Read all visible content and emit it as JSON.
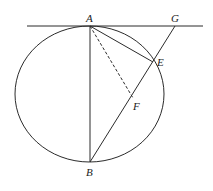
{
  "diagram": {
    "type": "geometry",
    "circle": {
      "cx": 89.5,
      "cy": 94,
      "rx": 74.5,
      "ry": 68
    },
    "tangent_line": {
      "x1": 27,
      "y1": 26,
      "x2": 203,
      "y2": 26
    },
    "points": {
      "A": {
        "label": "A",
        "x": 90,
        "y": 26
      },
      "G": {
        "label": "G",
        "x": 175,
        "y": 26
      },
      "E": {
        "label": "E",
        "x": 153,
        "y": 62
      },
      "F": {
        "label": "F",
        "x": 133,
        "y": 98
      },
      "B": {
        "label": "B",
        "x": 90,
        "y": 162
      }
    },
    "segments": [
      {
        "from": "A",
        "to": "B",
        "style": "solid"
      },
      {
        "from": "A",
        "to": "E",
        "style": "solid"
      },
      {
        "from": "B",
        "to": "G",
        "style": "solid"
      },
      {
        "from": "A",
        "to": "F",
        "style": "dashed"
      }
    ],
    "labels": {
      "A": "A",
      "G": "G",
      "E": "E",
      "F": "F",
      "B": "B"
    }
  }
}
